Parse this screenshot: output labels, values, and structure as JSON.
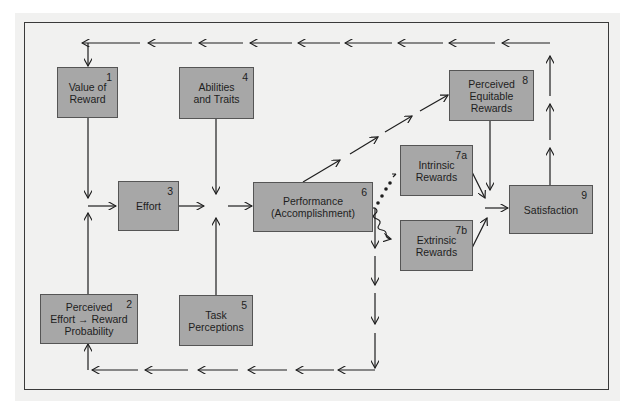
{
  "colors": {
    "box_fill": "#a7a7a7",
    "box_border": "#555555",
    "line": "#1e1e1e",
    "background": "#f1f1f0"
  },
  "nodes": [
    {
      "id": "1",
      "num": "1",
      "label": "Value of\nReward"
    },
    {
      "id": "2",
      "num": "2",
      "label": "Perceived\nEffort → Reward\nProbability"
    },
    {
      "id": "3",
      "num": "3",
      "label": "Effort"
    },
    {
      "id": "4",
      "num": "4",
      "label": "Abilities\nand Traits"
    },
    {
      "id": "5",
      "num": "5",
      "label": "Task\nPerceptions"
    },
    {
      "id": "6",
      "num": "6",
      "label": "Performance\n(Accomplishment)"
    },
    {
      "id": "7a",
      "num": "7a",
      "label": "Intrinsic\nRewards"
    },
    {
      "id": "7b",
      "num": "7b",
      "label": "Extrinsic\nRewards"
    },
    {
      "id": "8",
      "num": "8",
      "label": "Perceived\nEquitable\nRewards"
    },
    {
      "id": "9",
      "num": "9",
      "label": "Satisfaction"
    }
  ],
  "edges": [
    {
      "from": "1",
      "to": "3",
      "style": "solid"
    },
    {
      "from": "2",
      "to": "3",
      "style": "solid"
    },
    {
      "from": "3",
      "to": "6",
      "style": "solid"
    },
    {
      "from": "4",
      "to": "6",
      "style": "solid"
    },
    {
      "from": "5",
      "to": "6",
      "style": "solid"
    },
    {
      "from": "6",
      "to": "8",
      "style": "dashed-arrows"
    },
    {
      "from": "6",
      "to": "7a",
      "style": "dotted"
    },
    {
      "from": "6",
      "to": "7b",
      "style": "wavy"
    },
    {
      "from": "6",
      "to": "2",
      "style": "dashed-arrows (feedback)"
    },
    {
      "from": "7a",
      "to": "9",
      "style": "solid"
    },
    {
      "from": "7b",
      "to": "9",
      "style": "solid"
    },
    {
      "from": "8",
      "to": "9",
      "style": "solid"
    },
    {
      "from": "9",
      "to": "1",
      "style": "dashed-arrows (feedback)"
    }
  ]
}
